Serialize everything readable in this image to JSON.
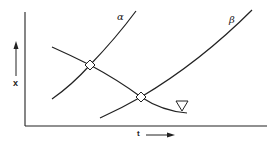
{
  "diagram": {
    "y_axis_label": "x",
    "x_axis_label": "t",
    "curves": [
      {
        "id": "alpha",
        "label": "α",
        "description": "rising curve"
      },
      {
        "id": "beta",
        "label": "β",
        "description": "rising curve, shifted right"
      },
      {
        "id": "descending",
        "label": "",
        "description": "falling curve crossing alpha and beta"
      }
    ],
    "markers": [
      {
        "type": "diamond",
        "at": "alpha × descending intersection"
      },
      {
        "type": "diamond",
        "at": "beta × descending intersection"
      }
    ],
    "symbol": "∇",
    "colors": {
      "line": "#222222",
      "background": "#ffffff"
    }
  }
}
